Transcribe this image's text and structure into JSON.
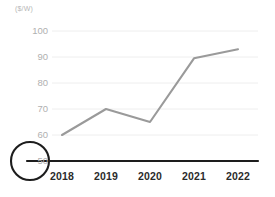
{
  "chart_data": {
    "type": "line",
    "title": "",
    "subtitle": "",
    "xlabel": "",
    "ylabel": "",
    "unit_label": "($/W)",
    "categories": [
      "2018",
      "2019",
      "2020",
      "2021",
      "2022"
    ],
    "values": [
      60,
      70,
      65,
      89.5,
      93
    ],
    "series": [
      {
        "name": "series-1",
        "values": [
          60,
          70,
          65,
          89.5,
          93
        ],
        "color": "#9a9a9a"
      }
    ],
    "ylim": [
      50,
      100
    ],
    "yticks": [
      100,
      90,
      80,
      70,
      60,
      50
    ],
    "ytick_labels": [
      "100",
      "90",
      "80",
      "70",
      "60",
      "50"
    ],
    "xtick_labels": [
      "2018",
      "2019",
      "2020",
      "2021",
      "2022"
    ],
    "grid": true,
    "grid_color": "#eeeeee",
    "legend": false,
    "legend_position": "none",
    "axis_color": "#1d1d1d",
    "tick_label_color_y": "#b0b0b0",
    "tick_label_color_x": "#2b2b2b",
    "annotations": [
      {
        "name": "baseline-tick-highlight",
        "type": "circle",
        "target_label": "50",
        "color": "#1d1d1d"
      }
    ]
  }
}
